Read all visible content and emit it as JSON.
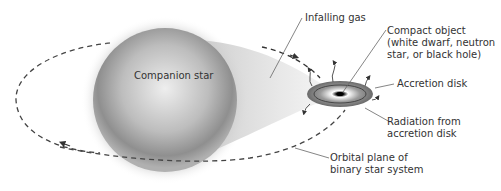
{
  "diagram": {
    "labels": {
      "companion_star": "Companion star",
      "infalling_gas": "Infalling gas",
      "compact_object": [
        "Compact object",
        "(white dwarf, neutron",
        "star, or black hole)"
      ],
      "accretion_disk": "Accretion disk",
      "radiation": [
        "Radiation from",
        "accretion disk"
      ],
      "orbital_plane": [
        "Orbital plane of",
        "binary star system"
      ]
    },
    "colors": {
      "star_light": "#e6e6e6",
      "star_dark": "#8a8a8a",
      "disk": "#6e6e6e",
      "orbit_line": "#444444",
      "label_text": "#333333",
      "leader_line": "#666666"
    }
  }
}
